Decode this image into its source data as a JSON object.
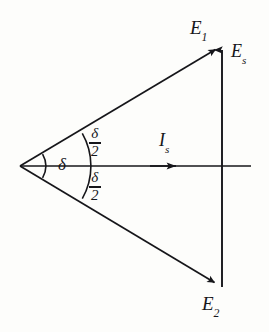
{
  "figure": {
    "type": "phasor-vector-diagram",
    "background_color": "#fdfdfb",
    "line_color": "#16161a"
  },
  "labels": {
    "e1": {
      "base": "E",
      "sub": "1",
      "full": "E₁"
    },
    "e2": {
      "base": "E",
      "sub": "2",
      "full": "E₂"
    },
    "es": {
      "base": "E",
      "sub": "s",
      "full": "Es"
    },
    "is": {
      "base": "I",
      "sub": "s",
      "full": "Is"
    },
    "delta": "δ",
    "half_delta_top": {
      "numerator": "δ",
      "denominator": "2"
    },
    "half_delta_bottom": {
      "numerator": "δ",
      "denominator": "2"
    }
  },
  "vectors": [
    {
      "name": "E1",
      "from": [
        20,
        166
      ],
      "to": [
        218,
        47
      ],
      "arrow": true
    },
    {
      "name": "E2",
      "from": [
        20,
        166
      ],
      "to": [
        217,
        285
      ],
      "arrow": true
    },
    {
      "name": "Es",
      "from": [
        222,
        287
      ],
      "to": [
        222,
        42
      ],
      "arrow": true
    },
    {
      "name": "Is",
      "from": [
        20,
        166
      ],
      "to": [
        250,
        166
      ],
      "arrow": true,
      "arrow_at": [
        178,
        166
      ]
    }
  ],
  "arcs": [
    {
      "name": "delta-arc-inner",
      "radius": 24,
      "center": [
        20,
        166
      ]
    },
    {
      "name": "delta-half-arc-outer",
      "radius": 66,
      "center": [
        20,
        166
      ]
    }
  ]
}
